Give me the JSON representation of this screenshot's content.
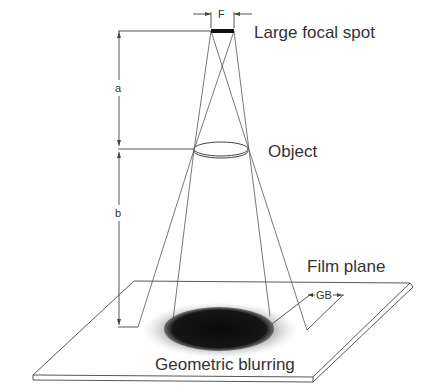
{
  "diagram": {
    "labels": {
      "focal_spot": "Large focal spot",
      "focal_width": "F",
      "object": "Object",
      "distance_a": "a",
      "distance_b": "b",
      "film_plane": "Film plane",
      "blur_width": "GB",
      "blurring": "Geometric blurring"
    },
    "colors": {
      "line": "#444444",
      "text": "#333333",
      "umbra": "#111111",
      "penumbra": "#9a9a9a",
      "background": "#ffffff"
    }
  }
}
